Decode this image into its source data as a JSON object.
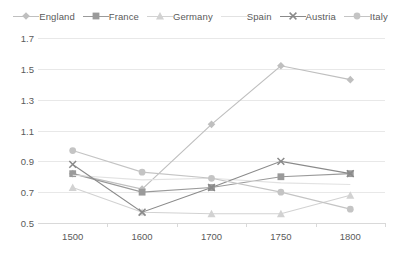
{
  "legend": {
    "position": "top",
    "entries": [
      {
        "label": "England",
        "color": "#bfbfbf",
        "marker": "diamond"
      },
      {
        "label": "France",
        "color": "#9a9a9a",
        "marker": "square"
      },
      {
        "label": "Germany",
        "color": "#d2d2d2",
        "marker": "triangle"
      },
      {
        "label": "Spain",
        "color": "#e2e2e2",
        "marker": "none"
      },
      {
        "label": "Austria",
        "color": "#8a8a8a",
        "marker": "cross"
      },
      {
        "label": "Italy",
        "color": "#c4c4c4",
        "marker": "circle"
      }
    ]
  },
  "axes": {
    "y_ticks": [
      "1.7",
      "1.5",
      "1.3",
      "1.1",
      "0.9",
      "0.7",
      "0.5"
    ],
    "x_ticks": [
      "1500",
      "1600",
      "1700",
      "1750",
      "1800"
    ],
    "ylim": [
      0.5,
      1.7
    ],
    "ystep": 0.2,
    "xlabel": "",
    "ylabel": ""
  },
  "chart_data": {
    "type": "line",
    "title": "",
    "subtitle": "",
    "xlabel": "",
    "ylabel": "",
    "ylim": [
      0.5,
      1.7
    ],
    "grid": true,
    "legend_position": "top",
    "categories": [
      "1500",
      "1600",
      "1700",
      "1750",
      "1800"
    ],
    "series": [
      {
        "name": "England",
        "color": "#bfbfbf",
        "marker": "diamond",
        "values": [
          0.82,
          0.72,
          1.14,
          1.52,
          1.43
        ]
      },
      {
        "name": "France",
        "color": "#9a9a9a",
        "marker": "square",
        "values": [
          0.82,
          0.7,
          0.73,
          0.8,
          0.82
        ]
      },
      {
        "name": "Germany",
        "color": "#d2d2d2",
        "marker": "triangle",
        "values": [
          0.73,
          0.57,
          0.56,
          0.56,
          0.68
        ]
      },
      {
        "name": "Spain",
        "color": "#e2e2e2",
        "marker": "none",
        "values": [
          0.81,
          0.78,
          0.79,
          0.76,
          0.75
        ]
      },
      {
        "name": "Austria",
        "color": "#8a8a8a",
        "marker": "cross",
        "values": [
          0.88,
          0.57,
          0.73,
          0.9,
          0.82
        ]
      },
      {
        "name": "Italy",
        "color": "#c4c4c4",
        "marker": "circle",
        "values": [
          0.97,
          0.83,
          0.79,
          0.7,
          0.59
        ]
      }
    ]
  }
}
